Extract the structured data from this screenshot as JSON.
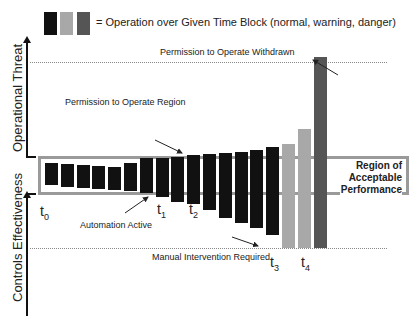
{
  "legend": {
    "text": "= Operation over Given Time Block (normal, warning, danger)",
    "colors": {
      "normal": "#111111",
      "warning": "#a8a8a8",
      "danger": "#555555"
    }
  },
  "axes": {
    "upper_label": "Operational Threat",
    "lower_label": "Controls Effectiveness"
  },
  "annotations": {
    "withdrawn": "Permission to Operate Withdrawn",
    "permission_region": "Permission to Operate Region",
    "automation_active": "Automation Active",
    "manual_intervention": "Manual Intervention Required",
    "acceptable_region": [
      "Region of",
      "Acceptable",
      "Performance"
    ]
  },
  "time_markers": [
    {
      "base": "t",
      "sub": "0"
    },
    {
      "base": "t",
      "sub": "1"
    },
    {
      "base": "t",
      "sub": "2"
    },
    {
      "base": "t",
      "sub": "3"
    },
    {
      "base": "t",
      "sub": "4"
    }
  ],
  "chart_data": {
    "type": "bar",
    "title": "Operation over Given Time Block",
    "series_legend": [
      "normal",
      "warning",
      "danger"
    ],
    "baseline_note": "bars centered on Region of Acceptable Performance; extend up (threat) and down (controls effectiveness)",
    "bars": [
      {
        "state": "normal",
        "top": 163,
        "bottom": 185
      },
      {
        "state": "normal",
        "top": 164,
        "bottom": 187
      },
      {
        "state": "normal",
        "top": 165,
        "bottom": 188
      },
      {
        "state": "normal",
        "top": 166,
        "bottom": 189
      },
      {
        "state": "normal",
        "top": 167,
        "bottom": 190
      },
      {
        "state": "normal",
        "top": 163,
        "bottom": 191
      },
      {
        "state": "normal",
        "top": 158,
        "bottom": 193
      },
      {
        "state": "normal",
        "top": 158,
        "bottom": 197
      },
      {
        "state": "normal",
        "top": 157,
        "bottom": 202
      },
      {
        "state": "normal",
        "top": 155,
        "bottom": 204
      },
      {
        "state": "normal",
        "top": 154,
        "bottom": 210
      },
      {
        "state": "normal",
        "top": 153,
        "bottom": 218
      },
      {
        "state": "normal",
        "top": 152,
        "bottom": 223
      },
      {
        "state": "normal",
        "top": 150,
        "bottom": 228
      },
      {
        "state": "normal",
        "top": 147,
        "bottom": 235
      },
      {
        "state": "warning",
        "top": 144,
        "bottom": 248
      },
      {
        "state": "warning",
        "top": 129,
        "bottom": 248
      },
      {
        "state": "danger",
        "top": 57,
        "bottom": 248
      }
    ],
    "thresholds": {
      "permission_withdrawn_y": 62,
      "manual_intervention_y": 248
    },
    "region_of_acceptable_performance": {
      "top": 157,
      "bottom": 194
    }
  }
}
